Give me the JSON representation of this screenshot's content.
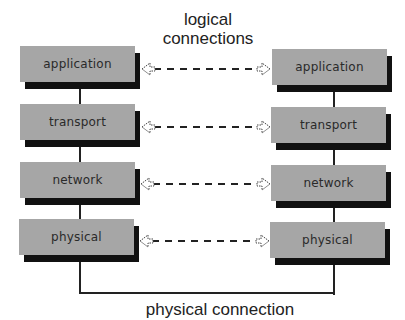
{
  "title": {
    "line1": "logical",
    "line2": "connections"
  },
  "bottom_label": "physical connection",
  "left_stack": [
    {
      "label": "application"
    },
    {
      "label": "transport"
    },
    {
      "label": "network"
    },
    {
      "label": "physical"
    }
  ],
  "right_stack": [
    {
      "label": "application"
    },
    {
      "label": "transport"
    },
    {
      "label": "network"
    },
    {
      "label": "physical"
    }
  ],
  "colors": {
    "box_fill": "#a6a6a6",
    "shadow": "#111111",
    "line": "#222222",
    "background": "#ffffff"
  }
}
